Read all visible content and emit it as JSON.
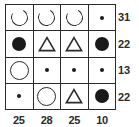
{
  "colors": {
    "ink": "#1a1a1a",
    "line": "#2b2b2b",
    "background": "#ffffff"
  },
  "grid": {
    "rows": 4,
    "columns": 4,
    "cells": [
      [
        {
          "symbol": "open-circle-gap",
          "label": "open circle"
        },
        {
          "symbol": "open-circle-gap",
          "label": "open circle"
        },
        {
          "symbol": "open-circle-gap",
          "label": "open circle"
        },
        {
          "symbol": "small-dot",
          "label": "small dot"
        }
      ],
      [
        {
          "symbol": "filled-circle",
          "label": "filled circle"
        },
        {
          "symbol": "triangle",
          "label": "triangle"
        },
        {
          "symbol": "triangle",
          "label": "triangle"
        },
        {
          "symbol": "filled-circle",
          "label": "filled circle"
        }
      ],
      [
        {
          "symbol": "open-circle",
          "label": "open circle"
        },
        {
          "symbol": "small-dot",
          "label": "small dot"
        },
        {
          "symbol": "small-dot",
          "label": "small dot"
        },
        {
          "symbol": "small-dot",
          "label": "small dot"
        }
      ],
      [
        {
          "symbol": "small-dot",
          "label": "small dot"
        },
        {
          "symbol": "open-circle",
          "label": "open circle"
        },
        {
          "symbol": "triangle",
          "label": "triangle"
        },
        {
          "symbol": "filled-circle",
          "label": "filled circle"
        }
      ]
    ]
  },
  "row_sums": [
    "31",
    "22",
    "13",
    "22"
  ],
  "column_sums": [
    "25",
    "28",
    "25",
    "10"
  ]
}
